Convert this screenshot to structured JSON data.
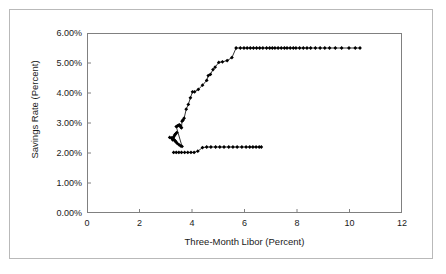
{
  "figure": {
    "frame_color": "#b9b9b9",
    "axis_color": "#808080",
    "series_color": "#000000",
    "background": "#ffffff"
  },
  "chart_data": {
    "type": "scatter",
    "title": "",
    "xlabel": "Three-Month Libor (Percent)",
    "ylabel": "Savings Rate (Percent)",
    "xlim": [
      0,
      12
    ],
    "ylim": [
      0,
      6
    ],
    "xticks": [
      0,
      2,
      4,
      6,
      8,
      10,
      12
    ],
    "yticks": [
      0,
      1,
      2,
      3,
      4,
      5,
      6
    ],
    "xtick_labels": [
      "0",
      "2",
      "4",
      "6",
      "8",
      "10",
      "12"
    ],
    "ytick_labels": [
      "0.00%",
      "1.00%",
      "2.00%",
      "3.00%",
      "4.00%",
      "5.00%",
      "6.00%"
    ],
    "grid": false,
    "legend": null,
    "marker": "filled-diamond",
    "line_style": "solid",
    "series": [
      {
        "name": "Savings rate vs three-month Libor",
        "x": [
          3.15,
          3.22,
          3.3,
          3.34,
          3.38,
          3.42,
          3.3,
          3.26,
          3.34,
          3.36,
          3.4,
          3.44,
          3.5,
          3.56,
          3.62,
          3.4,
          3.44,
          3.48,
          3.52,
          3.56,
          3.58,
          3.6,
          3.62,
          3.66,
          3.7,
          3.78,
          3.86,
          3.94,
          4.02,
          4.1,
          4.24,
          4.4,
          4.56,
          4.62,
          4.7,
          4.8,
          4.88,
          5.02,
          5.16,
          5.34,
          5.52,
          5.68,
          5.84,
          5.98,
          6.1,
          6.22,
          6.34,
          6.46,
          6.58,
          6.7,
          6.84,
          6.96,
          7.06,
          7.16,
          7.28,
          7.4,
          7.52,
          7.62,
          7.74,
          7.86,
          7.96,
          8.1,
          8.24,
          8.38,
          8.52,
          8.7,
          8.88,
          9.06,
          9.24,
          9.46,
          9.7,
          9.98,
          10.22,
          10.4
        ],
        "y": [
          2.52,
          2.5,
          2.54,
          2.6,
          2.64,
          2.68,
          2.46,
          2.44,
          2.42,
          2.4,
          2.36,
          2.32,
          2.28,
          2.24,
          2.22,
          2.88,
          2.9,
          2.92,
          2.94,
          2.9,
          2.86,
          2.84,
          3.06,
          3.1,
          3.16,
          3.46,
          3.62,
          3.84,
          4.04,
          4.04,
          4.12,
          4.26,
          4.42,
          4.58,
          4.62,
          4.78,
          4.86,
          5.02,
          5.04,
          5.08,
          5.18,
          5.5,
          5.5,
          5.5,
          5.5,
          5.5,
          5.5,
          5.5,
          5.5,
          5.5,
          5.5,
          5.5,
          5.5,
          5.5,
          5.5,
          5.5,
          5.5,
          5.5,
          5.5,
          5.5,
          5.5,
          5.5,
          5.5,
          5.5,
          5.5,
          5.5,
          5.5,
          5.5,
          5.5,
          5.5,
          5.5,
          5.5,
          5.5,
          5.5
        ]
      },
      {
        "name": "Lower branch",
        "x": [
          3.3,
          3.4,
          3.5,
          3.6,
          3.72,
          3.84,
          3.96,
          4.08,
          4.22,
          4.4,
          4.56,
          4.72,
          4.9,
          5.06,
          5.22,
          5.4,
          5.56,
          5.72,
          5.9,
          6.06,
          6.2,
          6.32,
          6.44,
          6.56,
          6.64
        ],
        "y": [
          2.02,
          2.02,
          2.02,
          2.02,
          2.02,
          2.02,
          2.02,
          2.02,
          2.06,
          2.18,
          2.2,
          2.2,
          2.2,
          2.2,
          2.2,
          2.2,
          2.2,
          2.2,
          2.2,
          2.2,
          2.2,
          2.2,
          2.2,
          2.2,
          2.2
        ]
      }
    ]
  }
}
